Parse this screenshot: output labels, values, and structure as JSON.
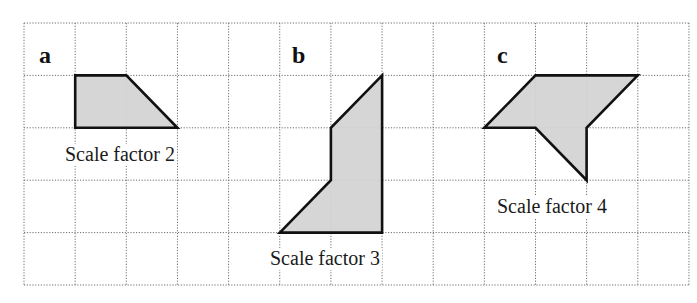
{
  "diagram": {
    "type": "grid-enlargement-exercise",
    "grid": {
      "columns": 13,
      "rows": 5,
      "origin_px": [
        24,
        23
      ],
      "cell_width_px": 51.15,
      "cell_height_px": 52.4,
      "line_style": "dotted",
      "line_color": "#6e6e6e"
    },
    "colors": {
      "shape_fill": "#d2d2d2",
      "shape_stroke": "#111111",
      "text": "#1a1a1a"
    },
    "parts": [
      {
        "letter": "a",
        "caption": "Scale factor 2",
        "vertices_grid": [
          [
            1,
            1
          ],
          [
            2,
            1
          ],
          [
            3,
            2
          ],
          [
            1,
            2
          ]
        ],
        "letter_pos": [
          39,
          63
        ],
        "caption_pos": [
          65,
          161
        ]
      },
      {
        "letter": "b",
        "caption": "Scale factor 3",
        "vertices_grid": [
          [
            7,
            1
          ],
          [
            7,
            4
          ],
          [
            5,
            4
          ],
          [
            6,
            3
          ],
          [
            6,
            2
          ]
        ],
        "letter_pos": [
          292,
          63
        ],
        "caption_pos": [
          270,
          265
        ]
      },
      {
        "letter": "c",
        "caption": "Scale factor 4",
        "vertices_grid": [
          [
            10,
            1
          ],
          [
            12,
            1
          ],
          [
            11,
            2
          ],
          [
            11,
            3
          ],
          [
            10,
            2
          ],
          [
            9,
            2
          ]
        ],
        "letter_pos": [
          497,
          63
        ],
        "caption_pos": [
          497,
          213
        ]
      }
    ]
  }
}
